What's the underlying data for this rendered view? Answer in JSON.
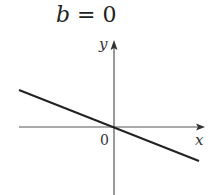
{
  "title": {
    "variable": "b",
    "operator": "=",
    "value": "0"
  },
  "axes": {
    "x_label": "x",
    "y_label": "y",
    "origin_label": "0"
  },
  "line": {
    "description": "line through origin with negative slope",
    "intercept": 0,
    "slope_sign": "negative"
  },
  "colors": {
    "axis": "#444444",
    "line": "#222222",
    "text": "#333333"
  }
}
